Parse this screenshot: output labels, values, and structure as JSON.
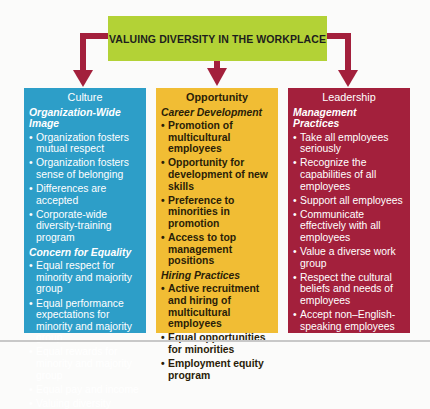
{
  "diagram": {
    "title": "VALUING DIVERSITY IN THE WORKPLACE",
    "colors": {
      "banner": "#b3d236",
      "arrow": "#a3203c",
      "culture": "#2d9ec8",
      "opportunity": "#f1bd34",
      "leadership": "#a3203c"
    },
    "columns": [
      {
        "title": "Culture",
        "sections": [
          {
            "heading": "Organization-Wide Image",
            "items": [
              "Organization fosters mutual respect",
              "Organization fosters sense of belonging",
              "Differences are accepted",
              "Corporate-wide diversity-training program"
            ]
          },
          {
            "heading": "Concern for Equality",
            "items": [
              "Equal respect for minority and majority group",
              "Equal performance expectations for minority and majority group",
              "Equal rewards for minority and majority group",
              "Equal pay and income",
              "Valuing diversity"
            ]
          }
        ]
      },
      {
        "title": "Opportunity",
        "sections": [
          {
            "heading": "Career Development",
            "items": [
              "Promotion of multicultural employees",
              "Opportunity for development of new skills",
              "Preference to minorities in promotion",
              "Access to top management positions"
            ]
          },
          {
            "heading": "Hiring Practices",
            "items": [
              "Active recruitment and hiring of multicultural employees",
              "Equal opportunities for minorities",
              "Employment equity program"
            ]
          }
        ]
      },
      {
        "title": "Leadership",
        "sections": [
          {
            "heading": "Management Practices",
            "items": [
              "Take all employees seriously",
              "Recognize the capabilities of all employees",
              "Support all employees",
              "Communicate effectively with all employees",
              "Value a diverse work group",
              "Respect the cultural beliefs and needs of employees",
              "Accept non–English-speaking employees"
            ]
          }
        ]
      }
    ]
  }
}
